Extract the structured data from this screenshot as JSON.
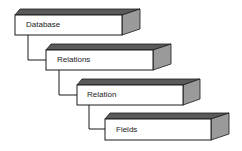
{
  "diagram": {
    "type": "hierarchy",
    "levels": [
      {
        "label": "Database"
      },
      {
        "label": "Relations"
      },
      {
        "label": "Relation"
      },
      {
        "label": "Fields"
      }
    ],
    "colors": {
      "front": "#ffffff",
      "top": "#5a5a5a",
      "side": "#9a9a9a",
      "stroke": "#1a1a1a"
    }
  }
}
